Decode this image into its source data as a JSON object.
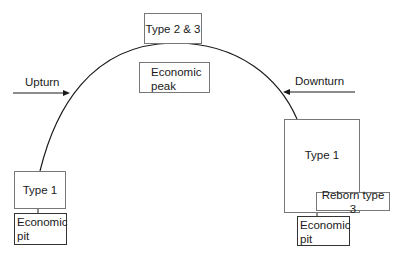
{
  "diagram": {
    "peak_label": "Type 2 & 3",
    "peak_box": [
      "Economic",
      "peak"
    ],
    "upturn_label": "Upturn",
    "downturn_label": "Downturn",
    "left_type_label": "Type 1",
    "left_pit": [
      "Economic",
      "pit"
    ],
    "right_type_label": "Type 1",
    "reborn_label": "Reborn type 3",
    "right_pit": [
      "Economic",
      "pit"
    ]
  },
  "colors": {
    "line": "#1a1a1a",
    "box_border": "#777777"
  }
}
